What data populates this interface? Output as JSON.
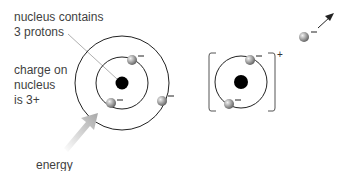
{
  "labels": {
    "nucleus_line1": "nucleus contains",
    "nucleus_line2": "3 protons",
    "charge_line1": "charge on",
    "charge_line2": "nucleus",
    "charge_line3": "is 3+",
    "energy": "energy"
  },
  "charges": {
    "electron": "–",
    "ion": "+"
  },
  "colors": {
    "nucleus": "#000000",
    "orbit": "#222222",
    "electron": "#8a8a8a",
    "arrow": "#b5b5b5"
  }
}
